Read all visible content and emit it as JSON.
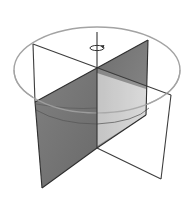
{
  "diagram": {
    "title": "Cylinder with two perpendicular intersecting planes rotating about central axis",
    "elements": {
      "cylinder_top": {
        "shape": "ellipse",
        "cx": 97,
        "cy": 70,
        "rx": 83,
        "ry": 43,
        "stroke": "#9a9a9a"
      },
      "rotation_axis": {
        "x": 97,
        "y1": 32,
        "y2": 148,
        "stroke": "#333333"
      },
      "rotation_arrow": {
        "icon": "rotation-arrow-icon",
        "cx": 96,
        "cy": 48
      },
      "plane_unshaded": {
        "fill": "#ffffff",
        "stroke": "#444444",
        "points": "33,44 171,95 161,179 97,148 33,100"
      },
      "plane_shaded": {
        "fill_back": "#6e6e6e",
        "fill_front_left": "#7a7a7a",
        "fill_front_right": "#c8c8c8",
        "stroke": "#333333",
        "points": "148,40 146,115 97,148 42,188 35,102"
      },
      "inner_arc": {
        "stroke": "#555555"
      }
    },
    "colors": {
      "background": "#ffffff",
      "line_dark": "#333333",
      "ellipse_gray": "#9a9a9a",
      "shade_dark": "#707070",
      "shade_light": "#cfcfcf"
    }
  }
}
